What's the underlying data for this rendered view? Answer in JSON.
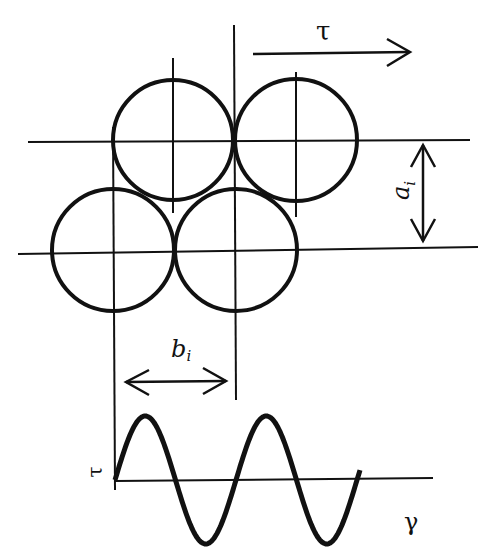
{
  "diagram": {
    "labels": {
      "shear_stress_top": "τ",
      "layer_spacing": "a",
      "layer_spacing_sub": "i",
      "particle_spacing": "b",
      "particle_spacing_sub": "i",
      "stress_axis": "τ",
      "strain_axis": "γ"
    },
    "circles": [
      {
        "id": "top-left",
        "cx": 173,
        "cy": 140,
        "r": 60
      },
      {
        "id": "top-right",
        "cx": 296,
        "cy": 140,
        "r": 61
      },
      {
        "id": "bottom-left",
        "cx": 113,
        "cy": 250,
        "r": 61
      },
      {
        "id": "bottom-right",
        "cx": 236,
        "cy": 250,
        "r": 61
      }
    ],
    "wave": {
      "type": "sine",
      "start_x": 115,
      "end_x": 360,
      "axis_y": 480,
      "amplitude": 64,
      "period": 121
    },
    "colors": {
      "line": "#111111",
      "background": "#ffffff"
    }
  }
}
